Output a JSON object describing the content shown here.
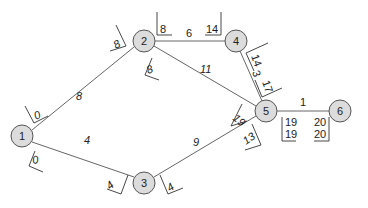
{
  "diagram": {
    "type": "network-cpm",
    "colors": {
      "node_fill": "#dcdcdc",
      "node_stroke": "#555555",
      "edge": "#666666",
      "text": "#222222"
    },
    "nodes": [
      {
        "id": "1",
        "label": "1",
        "x": 22,
        "y": 136
      },
      {
        "id": "2",
        "label": "2",
        "x": 144,
        "y": 41
      },
      {
        "id": "3",
        "label": "3",
        "x": 144,
        "y": 183
      },
      {
        "id": "4",
        "label": "4",
        "x": 236,
        "y": 41
      },
      {
        "id": "5",
        "label": "5",
        "x": 266,
        "y": 111
      },
      {
        "id": "6",
        "label": "6",
        "x": 340,
        "y": 111
      }
    ],
    "edges": [
      {
        "from": "1",
        "to": "2",
        "weight": "8"
      },
      {
        "from": "1",
        "to": "3",
        "weight": "4"
      },
      {
        "from": "2",
        "to": "4",
        "weight": "6"
      },
      {
        "from": "2",
        "to": "5",
        "weight": "11"
      },
      {
        "from": "4",
        "to": "5",
        "weight": "3"
      },
      {
        "from": "3",
        "to": "5",
        "weight": "9"
      },
      {
        "from": "5",
        "to": "6",
        "weight": "1"
      }
    ],
    "time_labels": {
      "n1_out_top": "0",
      "n1_out_bottom": "0",
      "n2_in": "8",
      "n2_out_right": "8",
      "n2_out_down": "8",
      "n4_in": "14",
      "n4_out": "14",
      "n5_in_from4": "17",
      "n5_in_from2": "19",
      "n5_in_from3": "13",
      "n3_in": "4",
      "n3_out": "4",
      "n5_out_top": "19",
      "n5_out_bottom": "19",
      "n6_in_top": "20",
      "n6_in_bottom": "20"
    }
  }
}
